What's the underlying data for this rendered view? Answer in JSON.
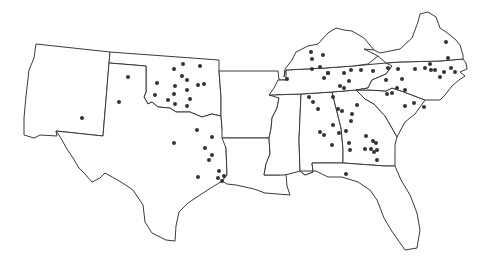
{
  "map": {
    "description": "Southern United States outline map with location dots",
    "colors": {
      "outline": "#3a3a3a",
      "dot": "#333333",
      "background": "#ffffff"
    },
    "states": [
      {
        "name": "New Mexico",
        "path": "M36,44 L110,52 L103,136 L56,131 L57,136 L40,135 L34,138 L24,135 L24,118 L26,96 L29,70 L34,58 Z"
      },
      {
        "name": "Oklahoma",
        "path": "M110,52 L219,60 L219,71 L221,97 L221,116 L212,114 L202,117 L190,112 L176,112 L170,108 L158,107 L152,102 L148,104 L144,97 L146,92 L146,66 L109,63 Z"
      },
      {
        "name": "Texas",
        "path": "M109,63 L146,66 L146,92 L144,97 L148,104 L152,102 L158,107 L170,108 L176,112 L190,112 L202,117 L212,114 L221,116 L222,128 L226,148 L227,175 L222,181 L214,186 L203,193 L188,203 L179,212 L176,226 L175,241 L166,240 L152,233 L145,222 L143,205 L133,190 L121,182 L105,173 L100,178 L92,182 L84,173 L79,168 L73,158 L67,149 L59,135 L56,131 L103,136 Z"
      },
      {
        "name": "Arkansas",
        "path": "M219,71 L278,71 L279,80 L286,80 L282,90 L279,98 L277,108 L272,118 L271,129 L269,138 L222,138 L222,128 L221,116 L221,97 Z"
      },
      {
        "name": "Louisiana",
        "path": "M222,138 L269,138 L270,154 L266,164 L264,175 L278,175 L286,174 L287,186 L290,195 L278,194 L265,193 L254,189 L245,187 L236,185 L227,184 L222,181 L227,175 L226,148 Z"
      },
      {
        "name": "Mississippi",
        "path": "M269,95 L301,94 L299,140 L300,171 L289,174 L284,175 L278,175 L264,175 L266,164 L270,154 L269,138 L271,129 L272,118 L277,108 L279,98 Z"
      },
      {
        "name": "Alabama",
        "path": "M301,94 L332,92 L341,128 L343,149 L343,163 L312,163 L313,172 L305,175 L300,171 L299,140 Z"
      },
      {
        "name": "Georgia",
        "path": "M332,92 L356,90 L365,99 L374,104 L385,116 L392,128 L397,137 L395,145 L395,166 L385,166 L343,163 L343,149 L341,128 Z"
      },
      {
        "name": "Florida",
        "path": "M300,171 L305,175 L313,172 L312,163 L343,163 L385,166 L395,166 L401,180 L410,195 L417,213 L420,230 L417,248 L405,250 L398,240 L391,230 L384,218 L377,200 L370,190 L358,182 L342,177 L328,177 L316,171 Z"
      },
      {
        "name": "South Carolina",
        "path": "M356,90 L369,90 L386,91 L392,88 L404,92 L425,100 L415,114 L405,122 L397,137 L392,128 L385,116 L374,104 L365,99 Z"
      },
      {
        "name": "Tennessee",
        "path": "M286,70 L325,68 L353,66 L386,63 L400,62 L392,66 L386,74 L372,80 L368,88 L356,90 L332,92 L301,94 L269,95 L274,88 L278,80 L286,80 Z"
      },
      {
        "name": "North Carolina",
        "path": "M386,63 L400,62 L440,61 L463,59 L466,63 L467,69 L460,72 L465,76 L459,80 L452,86 L445,95 L440,100 L425,100 L404,92 L392,88 L386,91 L369,90 L356,90 L368,88 L372,80 L386,74 L392,66 Z"
      },
      {
        "name": "Kentucky",
        "path": "M284,77 L285,69 L292,60 L296,52 L308,46 L318,44 L328,33 L336,28 L344,30 L352,31 L364,38 L374,50 L378,56 L373,60 L368,64 L353,66 L325,68 L286,70 Z"
      },
      {
        "name": "Virginia",
        "path": "M364,49 L374,50 L380,53 L390,51 L400,49 L412,38 L418,22 L420,14 L428,12 L436,17 L440,28 L446,32 L455,39 L460,45 L463,55 L463,59 L440,61 L400,62 L386,63 L378,56 Z"
      }
    ],
    "dots": [
      [
        82,
        118
      ],
      [
        128,
        77
      ],
      [
        119,
        102
      ],
      [
        174,
        69
      ],
      [
        183,
        64
      ],
      [
        200,
        66
      ],
      [
        182,
        76
      ],
      [
        187,
        80
      ],
      [
        157,
        83
      ],
      [
        155,
        95
      ],
      [
        175,
        86
      ],
      [
        174,
        94
      ],
      [
        168,
        100
      ],
      [
        175,
        104
      ],
      [
        187,
        90
      ],
      [
        187,
        106
      ],
      [
        190,
        99
      ],
      [
        198,
        85
      ],
      [
        204,
        84
      ],
      [
        197,
        130
      ],
      [
        174,
        143
      ],
      [
        212,
        137
      ],
      [
        205,
        148
      ],
      [
        212,
        155
      ],
      [
        209,
        160
      ],
      [
        198,
        177
      ],
      [
        219,
        171
      ],
      [
        218,
        178
      ],
      [
        224,
        176
      ],
      [
        222,
        181
      ],
      [
        287,
        79
      ],
      [
        311,
        52
      ],
      [
        312,
        59
      ],
      [
        323,
        55
      ],
      [
        312,
        69
      ],
      [
        320,
        67
      ],
      [
        328,
        73
      ],
      [
        324,
        78
      ],
      [
        328,
        73
      ],
      [
        344,
        73
      ],
      [
        349,
        81
      ],
      [
        340,
        86
      ],
      [
        344,
        88
      ],
      [
        351,
        70
      ],
      [
        361,
        70
      ],
      [
        373,
        71
      ],
      [
        388,
        68
      ],
      [
        398,
        69
      ],
      [
        415,
        69
      ],
      [
        425,
        68
      ],
      [
        430,
        64
      ],
      [
        431,
        70
      ],
      [
        435,
        70
      ],
      [
        440,
        77
      ],
      [
        444,
        72
      ],
      [
        451,
        68
      ],
      [
        455,
        72
      ],
      [
        386,
        80
      ],
      [
        402,
        79
      ],
      [
        392,
        93
      ],
      [
        387,
        94
      ],
      [
        397,
        88
      ],
      [
        405,
        90
      ],
      [
        414,
        103
      ],
      [
        424,
        107
      ],
      [
        405,
        106
      ],
      [
        309,
        97
      ],
      [
        313,
        102
      ],
      [
        318,
        109
      ],
      [
        333,
        97
      ],
      [
        338,
        109
      ],
      [
        342,
        111
      ],
      [
        333,
        125
      ],
      [
        332,
        145
      ],
      [
        357,
        105
      ],
      [
        352,
        114
      ],
      [
        351,
        121
      ],
      [
        346,
        131
      ],
      [
        320,
        132
      ],
      [
        324,
        135
      ],
      [
        339,
        133
      ],
      [
        349,
        143
      ],
      [
        366,
        136
      ],
      [
        373,
        141
      ],
      [
        374,
        152
      ],
      [
        350,
        150
      ],
      [
        365,
        149
      ],
      [
        371,
        149
      ],
      [
        377,
        150
      ],
      [
        377,
        160
      ],
      [
        376,
        143
      ],
      [
        346,
        174
      ],
      [
        446,
        42
      ],
      [
        448,
        58
      ]
    ]
  }
}
